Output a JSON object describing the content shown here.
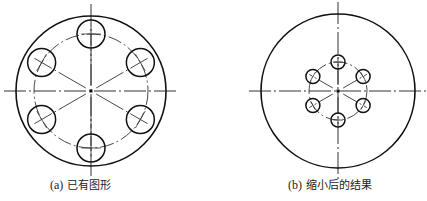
{
  "figures": [
    {
      "id": "a",
      "caption_tag": "(a)",
      "caption_text": "已有图形",
      "center": [
        91,
        91
      ],
      "outer_radius": 75,
      "bolt_circle_radius": 57,
      "hole_radius": 14,
      "hole_count": 6,
      "hole_angles_deg": [
        90,
        30,
        -30,
        -90,
        -150,
        150
      ]
    },
    {
      "id": "b",
      "caption_tag": "(b)",
      "caption_text": "缩小后的结果",
      "center": [
        338,
        91
      ],
      "outer_radius": 77,
      "bolt_circle_radius": 29,
      "hole_radius": 7,
      "hole_count": 6,
      "hole_angles_deg": [
        90,
        30,
        -30,
        -90,
        -150,
        150
      ]
    }
  ],
  "colors": {
    "stroke": "#111111",
    "centerline": "#333333",
    "background": "#ffffff"
  }
}
